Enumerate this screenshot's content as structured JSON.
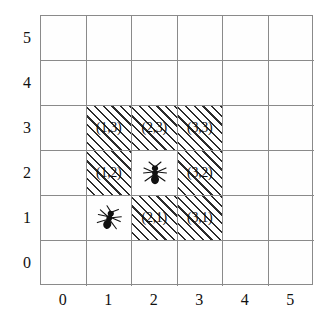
{
  "figure": {
    "title": "",
    "grid": {
      "columns": 6,
      "rows": 6,
      "x_ticks": [
        "0",
        "1",
        "2",
        "3",
        "4",
        "5"
      ],
      "y_ticks": [
        "0",
        "1",
        "2",
        "3",
        "4",
        "5"
      ],
      "grid_line_color": "#8a8a8a",
      "background_color": "#fefefe"
    },
    "cells": [
      {
        "col": 1,
        "row": 3,
        "label": "(1,3)",
        "hatched": true,
        "ant": false
      },
      {
        "col": 2,
        "row": 3,
        "label": "(2,3)",
        "hatched": true,
        "ant": false
      },
      {
        "col": 3,
        "row": 3,
        "label": "(3,3)",
        "hatched": true,
        "ant": false
      },
      {
        "col": 1,
        "row": 2,
        "label": "(1,2)",
        "hatched": true,
        "ant": false
      },
      {
        "col": 2,
        "row": 2,
        "label": "",
        "hatched": false,
        "ant": true
      },
      {
        "col": 3,
        "row": 2,
        "label": "(3,2)",
        "hatched": true,
        "ant": false
      },
      {
        "col": 1,
        "row": 1,
        "label": "",
        "hatched": false,
        "ant": true
      },
      {
        "col": 2,
        "row": 1,
        "label": "(2,1)",
        "hatched": true,
        "ant": false
      },
      {
        "col": 3,
        "row": 1,
        "label": "(3,1)",
        "hatched": true,
        "ant": false
      }
    ],
    "ants": [
      {
        "col": 2,
        "row": 2,
        "name": "ant-marker-2-2",
        "rotation": 0
      },
      {
        "col": 1,
        "row": 1,
        "name": "ant-marker-1-1",
        "rotation": 18
      }
    ],
    "hatch_color": "#2b2b2b",
    "label_color": "#111111"
  },
  "chart_data": {
    "type": "heatmap",
    "title": "",
    "xlabel": "",
    "ylabel": "",
    "xlim": [
      0,
      6
    ],
    "ylim": [
      0,
      6
    ],
    "grid": true,
    "legend": null,
    "x_tick_labels": [
      "0",
      "1",
      "2",
      "3",
      "4",
      "5"
    ],
    "y_tick_labels": [
      "0",
      "1",
      "2",
      "3",
      "4",
      "5"
    ],
    "categories": [
      "(1,3)",
      "(2,3)",
      "(3,3)",
      "(1,2)",
      "(2,2)",
      "(3,2)",
      "(1,1)",
      "(2,1)",
      "(3,1)"
    ],
    "values": [
      1,
      1,
      1,
      1,
      0,
      1,
      0,
      1,
      1
    ],
    "annotations": [
      "(1,3)",
      "(2,3)",
      "(3,3)",
      "(1,2)",
      "(3,2)",
      "(2,1)",
      "(3,1)"
    ],
    "markers": [
      {
        "label": "ant",
        "x": 2,
        "y": 2
      },
      {
        "label": "ant",
        "x": 1,
        "y": 1
      }
    ]
  }
}
